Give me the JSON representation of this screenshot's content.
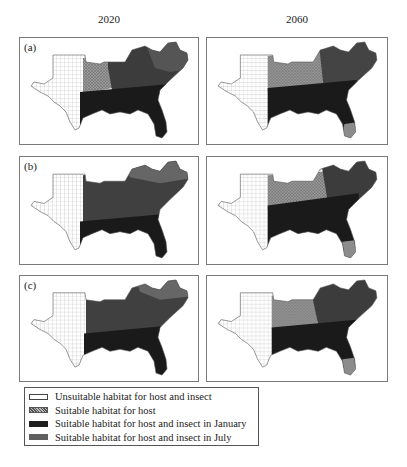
{
  "columns": [
    {
      "label": "2020"
    },
    {
      "label": "2060"
    }
  ],
  "rows": [
    {
      "label": "(a)"
    },
    {
      "label": "(b)"
    },
    {
      "label": "(c)"
    }
  ],
  "colors": {
    "unsuitable": "#ffffff",
    "host": "#8c8c8c",
    "january": "#1e1e1e",
    "july": "#5a5a5a",
    "outline": "#7a7a7a"
  },
  "legend": {
    "items": [
      {
        "key": "unsuitable",
        "label": "Unsuitable habitat for host and insect"
      },
      {
        "key": "host",
        "label": "Suitable habitat for host"
      },
      {
        "key": "january",
        "label": "Suitable habitat for host and insect in January"
      },
      {
        "key": "july",
        "label": "Suitable habitat for host and insect in July"
      }
    ]
  }
}
